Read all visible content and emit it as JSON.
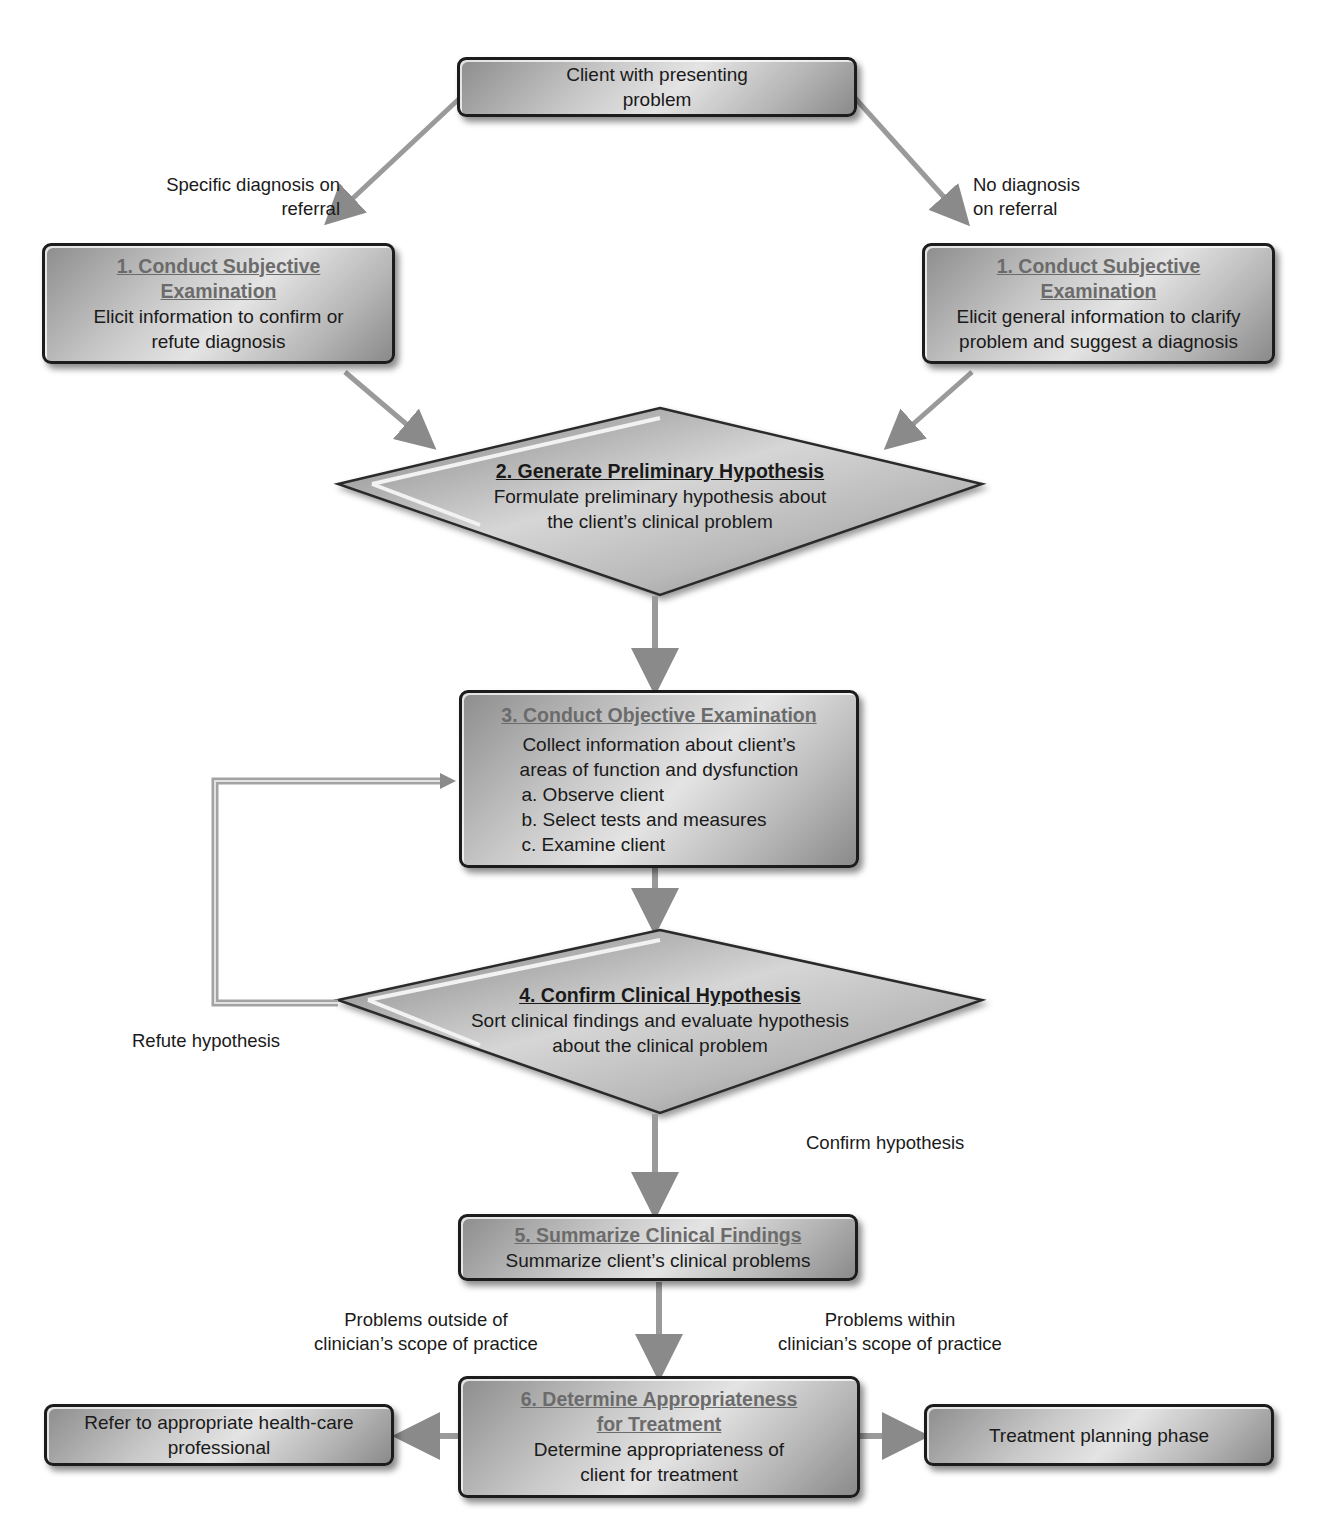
{
  "diagram": {
    "type": "flowchart",
    "start": {
      "text": "Client with presenting problem"
    },
    "branch_labels": {
      "left": "Specific diagnosis on referral",
      "right": "No diagnosis on referral"
    },
    "step1_left": {
      "title_line1": "1. Conduct Subjective",
      "title_line2": "Examination",
      "body_line1": "Elicit information to confirm or",
      "body_line2": "refute diagnosis"
    },
    "step1_right": {
      "title_line1": "1. Conduct Subjective",
      "title_line2": "Examination",
      "body_line1": "Elicit general  information to clarify",
      "body_line2": "problem and suggest a diagnosis"
    },
    "step2": {
      "title": "2. Generate Preliminary Hypothesis",
      "body_line1": "Formulate preliminary hypothesis about",
      "body_line2": "the client’s clinical problem"
    },
    "step3": {
      "title": "3. Conduct Objective Examination",
      "body_line1": "Collect information about client’s",
      "body_line2": "areas of function and dysfunction",
      "items": [
        "a. Observe client",
        "b. Select tests and measures",
        "c. Examine client"
      ]
    },
    "step4": {
      "title": "4. Confirm Clinical Hypothesis",
      "body_line1": "Sort clinical findings and evaluate hypothesis",
      "body_line2": "about the clinical problem"
    },
    "loop_label": "Refute hypothesis",
    "confirm_label": "Confirm hypothesis",
    "step5": {
      "title": "5. Summarize Clinical Findings",
      "body": "Summarize client’s clinical problems"
    },
    "scope_labels": {
      "outside_line1": "Problems outside of",
      "outside_line2": "clinician’s scope of practice",
      "within_line1": "Problems within",
      "within_line2": "clinician’s scope of practice"
    },
    "step6": {
      "title_line1": "6. Determine Appropriateness",
      "title_line2": "for Treatment",
      "body_line1": "Determine appropriateness of",
      "body_line2": "client for treatment"
    },
    "outcome_left": {
      "line1": "Refer to appropriate health-care",
      "line2": "professional"
    },
    "outcome_right": {
      "text": "Treatment planning phase"
    }
  },
  "colors": {
    "box_border": "#1c1c1c",
    "box_fill_light": "#e4e4e4",
    "box_fill_dark": "#8d8d8d",
    "title_gray": "#6b6b6b",
    "arrow_gray": "#9a9a9a"
  }
}
